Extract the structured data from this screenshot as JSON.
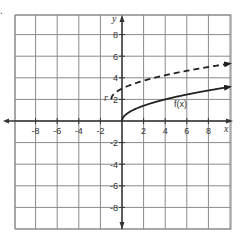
{
  "problem_marker": ".",
  "chart_data": {
    "type": "line",
    "title": "",
    "xlabel": "x",
    "ylabel": "y",
    "xlim": [
      -10,
      10
    ],
    "ylim": [
      -10,
      10
    ],
    "grid": true,
    "grid_step": 2,
    "x_ticks": [
      -8,
      -6,
      -4,
      -2,
      2,
      4,
      6,
      8
    ],
    "y_ticks": [
      8,
      6,
      4,
      2,
      -2,
      -4,
      -6,
      -8
    ],
    "x_tick_labels": [
      "-8",
      "-6",
      "-4",
      "-2",
      "2",
      "4",
      "6",
      "8"
    ],
    "y_tick_labels": [
      "8",
      "6",
      "4",
      "2",
      "-2",
      "-4",
      "-6",
      "-8"
    ],
    "series": [
      {
        "name": "f(x)",
        "style": "solid",
        "color": "#222222",
        "expression": "sqrt(x)",
        "x": [
          0,
          0.25,
          1,
          2,
          4,
          6,
          8,
          10
        ],
        "y": [
          0,
          0.5,
          1,
          1.41,
          2,
          2.45,
          2.83,
          3.16
        ]
      },
      {
        "name": "g(x)",
        "style": "dashed",
        "color": "#222222",
        "expression": "sqrt(x+1)+2",
        "x": [
          -1,
          -0.75,
          0,
          1,
          2,
          4,
          6,
          8,
          10
        ],
        "y": [
          2,
          2.5,
          3,
          3.41,
          3.73,
          4.24,
          4.65,
          5,
          5.32
        ]
      }
    ],
    "annotations": [
      {
        "text": "f(x)",
        "x": 5.2,
        "y": 1.6
      },
      {
        "text": "r",
        "x": -1.9,
        "y": 2.3
      }
    ]
  },
  "labels": {
    "x_axis": "x",
    "y_axis": "y",
    "f_label": "f(x)",
    "stray_mark": "r"
  },
  "colors": {
    "grid": "#8a8a8a",
    "axis": "#333333",
    "curve": "#222222",
    "border": "#8a8a8a"
  }
}
